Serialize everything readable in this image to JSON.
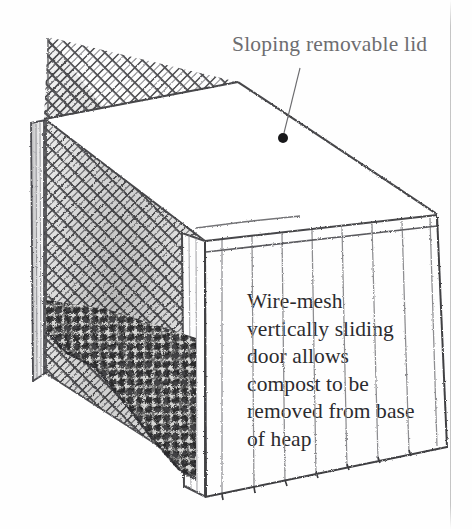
{
  "illustration": {
    "subject": "wire-mesh compost bin",
    "style": "pencil line drawing",
    "background_color": "#fefefe",
    "ink_color": "#3a3a3d"
  },
  "annotations": {
    "lid": {
      "text": "Sloping removable lid",
      "color": "#6d6d70",
      "callout_dot": {
        "x": 283,
        "y": 138,
        "color": "#1b1b1b",
        "radius": 5
      },
      "leader_line": {
        "x1": 300,
        "y1": 68,
        "x2": 284,
        "y2": 134
      }
    },
    "door": {
      "color": "#2b2b2e",
      "lines": [
        "Wire-mesh",
        "vertically sliding",
        "door allows",
        "compost to be",
        "removed from base",
        "of heap"
      ],
      "full_text": "Wire-mesh vertically sliding door allows compost to be removed from base of heap"
    }
  },
  "parts": {
    "lid": {
      "name": "sloping removable lid",
      "fill": "#ffffff"
    },
    "back_left_panel": {
      "name": "chain-link mesh back panel",
      "pattern": "diamond mesh"
    },
    "right_panel": {
      "name": "vertically sliding wire-mesh door",
      "pattern": "vertical wires"
    },
    "corner_post": {
      "name": "front corner post"
    },
    "left_post": {
      "name": "left frame post"
    },
    "heap": {
      "name": "compost heap",
      "tone": "dark textured mass"
    }
  },
  "scan": {
    "page_edge_x": 450
  }
}
